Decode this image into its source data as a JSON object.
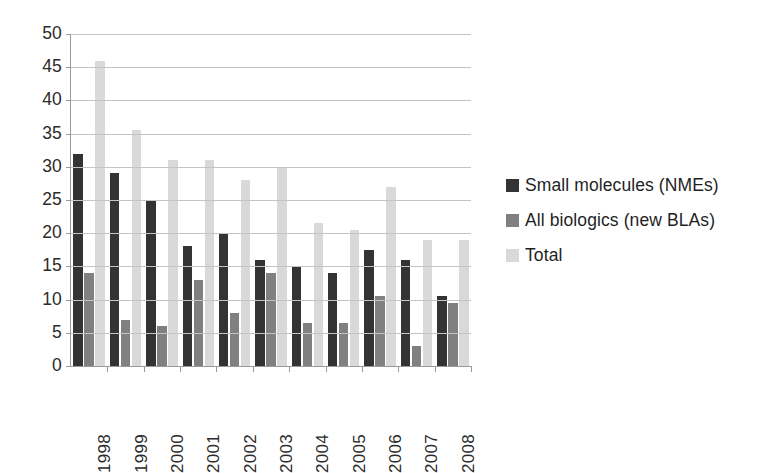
{
  "chart_data": {
    "type": "bar",
    "title": "",
    "subtitle": "",
    "xlabel": "",
    "ylabel": "",
    "categories": [
      "1998",
      "1999",
      "2000",
      "2001",
      "2002",
      "2003",
      "2004",
      "2005",
      "2006",
      "2007",
      "2008"
    ],
    "series": [
      {
        "name": "Small molecules (NMEs)",
        "color": "#333333",
        "values": [
          32,
          29,
          25,
          18,
          20,
          16,
          15,
          14,
          17.5,
          16,
          10.5
        ]
      },
      {
        "name": "All biologics (new BLAs)",
        "color": "#808080",
        "values": [
          14,
          7,
          6,
          13,
          8,
          14,
          6.5,
          6.5,
          10.5,
          3,
          9.5
        ]
      },
      {
        "name": "Total",
        "color": "#d9d9d9",
        "values": [
          46,
          35.5,
          31,
          31,
          28,
          30,
          21.5,
          20.5,
          27,
          19,
          19
        ]
      }
    ],
    "ylim": [
      0,
      50
    ],
    "ytick_step": 5,
    "yticks": [
      "0",
      "5",
      "10",
      "15",
      "20",
      "25",
      "30",
      "35",
      "40",
      "45",
      "50"
    ],
    "grid": true,
    "legend_position": "right",
    "background": "#ffffff",
    "gridline_color": "#c4c4c4",
    "axis_color": "#9a9a9a"
  },
  "legend": {
    "items": [
      {
        "label": "Small molecules (NMEs)",
        "color": "#333333",
        "icon": "legend-swatch-icon"
      },
      {
        "label": "All biologics (new BLAs)",
        "color": "#808080",
        "icon": "legend-swatch-icon"
      },
      {
        "label": "Total",
        "color": "#d9d9d9",
        "icon": "legend-swatch-icon"
      }
    ]
  }
}
